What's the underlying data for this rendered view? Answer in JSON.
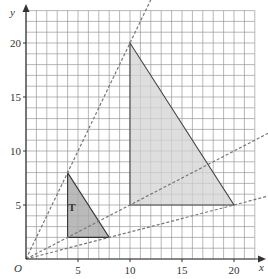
{
  "diagram": {
    "type": "coordinate-grid-enlargement",
    "axes": {
      "x_label": "x",
      "y_label": "y",
      "origin_label": "O",
      "x_ticks": [
        "5",
        "10",
        "15",
        "20"
      ],
      "y_ticks": [
        "5",
        "10",
        "15",
        "20"
      ],
      "x_max": 22,
      "y_max": 23
    },
    "shapes": {
      "small_triangle": {
        "label": "T",
        "vertices": [
          [
            4,
            8
          ],
          [
            4,
            2
          ],
          [
            8,
            2
          ]
        ],
        "fill": "#a9a9a9"
      },
      "large_triangle": {
        "label": "",
        "vertices": [
          [
            10,
            20
          ],
          [
            10,
            5
          ],
          [
            20,
            5
          ]
        ],
        "fill": "#d3d3d3"
      }
    },
    "construction_lines": [
      {
        "from": [
          0,
          0
        ],
        "through": [
          10,
          20
        ],
        "style": "dashed"
      },
      {
        "from": [
          0,
          0
        ],
        "through": [
          10,
          5
        ],
        "style": "dashed"
      },
      {
        "from": [
          0,
          0
        ],
        "through": [
          20,
          5
        ],
        "style": "dashed"
      }
    ],
    "colors": {
      "grid": "#9a9a9a",
      "axis": "#333333",
      "dash": "#777777"
    }
  }
}
